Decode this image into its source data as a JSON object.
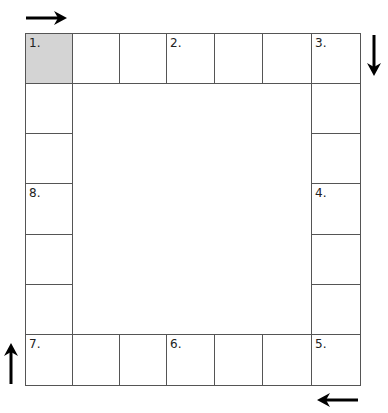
{
  "board": {
    "columns": 7,
    "rows": 7,
    "shaded_color": "#d4d4d4",
    "line_color": "#555555",
    "spaces": [
      {
        "col": 0,
        "row": 0,
        "label": "1.",
        "shaded": true
      },
      {
        "col": 1,
        "row": 0,
        "label": ""
      },
      {
        "col": 2,
        "row": 0,
        "label": ""
      },
      {
        "col": 3,
        "row": 0,
        "label": "2."
      },
      {
        "col": 4,
        "row": 0,
        "label": ""
      },
      {
        "col": 5,
        "row": 0,
        "label": ""
      },
      {
        "col": 6,
        "row": 0,
        "label": "3."
      },
      {
        "col": 6,
        "row": 1,
        "label": ""
      },
      {
        "col": 6,
        "row": 2,
        "label": ""
      },
      {
        "col": 6,
        "row": 3,
        "label": "4."
      },
      {
        "col": 6,
        "row": 4,
        "label": ""
      },
      {
        "col": 6,
        "row": 5,
        "label": ""
      },
      {
        "col": 6,
        "row": 6,
        "label": "5."
      },
      {
        "col": 5,
        "row": 6,
        "label": ""
      },
      {
        "col": 4,
        "row": 6,
        "label": ""
      },
      {
        "col": 3,
        "row": 6,
        "label": "6."
      },
      {
        "col": 2,
        "row": 6,
        "label": ""
      },
      {
        "col": 1,
        "row": 6,
        "label": ""
      },
      {
        "col": 0,
        "row": 6,
        "label": "7."
      },
      {
        "col": 0,
        "row": 5,
        "label": ""
      },
      {
        "col": 0,
        "row": 4,
        "label": ""
      },
      {
        "col": 0,
        "row": 3,
        "label": "8."
      },
      {
        "col": 0,
        "row": 2,
        "label": ""
      },
      {
        "col": 0,
        "row": 1,
        "label": ""
      }
    ]
  },
  "arrows": [
    {
      "name": "arrow-right-icon",
      "direction": "right"
    },
    {
      "name": "arrow-down-icon",
      "direction": "down"
    },
    {
      "name": "arrow-left-icon",
      "direction": "left"
    },
    {
      "name": "arrow-up-icon",
      "direction": "up"
    }
  ]
}
